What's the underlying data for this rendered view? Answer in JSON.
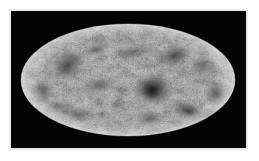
{
  "figure": {
    "kind": "all-sky-map",
    "projection": "Mollweide",
    "title": "",
    "caption": "",
    "background_color": "#ffffff",
    "panel_color": "#040404",
    "colormap": "grayscale",
    "has_axes": false,
    "has_colorbar": false,
    "has_gridlines": false,
    "has_text_labels": false
  },
  "panel": {
    "x": 11,
    "y": 11,
    "width": 235,
    "height": 137,
    "fill": "#040404",
    "shadow_color": "#e9e9e9"
  },
  "ellipse": {
    "center_x": 117,
    "center_y": 69,
    "radius_x": 107,
    "radius_y": 56,
    "base_light": "#d4d4d4",
    "base_mid": "#b4b4b4",
    "base_dark": "#6a6a6a",
    "deepest_dark": "#101010"
  },
  "chart_data": {
    "type": "heatmap",
    "title": "",
    "subtitle": "",
    "xlabel": "",
    "ylabel": "",
    "legend": [],
    "grid": false,
    "projection": "Mollweide full-sky ellipse",
    "colormap": "grayscale (light = low signal, dark = high signal)",
    "value_range_label": "",
    "tick_labels": [],
    "annotations": [],
    "features": [
      {
        "name": "central-dense-cluster",
        "cx": 0.235,
        "cy": 0.155,
        "rx": 0.115,
        "ry": 0.175,
        "intensity": 0.96
      },
      {
        "name": "upper-right-filament",
        "cx": 0.43,
        "cy": -0.43,
        "rx": 0.15,
        "ry": 0.11,
        "intensity": 0.72
      },
      {
        "name": "right-edge-knot",
        "cx": 0.83,
        "cy": 0.26,
        "rx": 0.095,
        "ry": 0.15,
        "intensity": 0.68
      },
      {
        "name": "lower-right-streak",
        "cx": 0.56,
        "cy": 0.56,
        "rx": 0.175,
        "ry": 0.105,
        "intensity": 0.66
      },
      {
        "name": "left-upper-patch",
        "cx": -0.56,
        "cy": -0.27,
        "rx": 0.17,
        "ry": 0.16,
        "intensity": 0.62
      },
      {
        "name": "left-edge-clump",
        "cx": -0.8,
        "cy": 0.19,
        "rx": 0.11,
        "ry": 0.17,
        "intensity": 0.6
      },
      {
        "name": "mid-left-band",
        "cx": -0.27,
        "cy": 0.11,
        "rx": 0.175,
        "ry": 0.095,
        "intensity": 0.55
      },
      {
        "name": "lower-left-arc",
        "cx": -0.48,
        "cy": 0.6,
        "rx": 0.15,
        "ry": 0.095,
        "intensity": 0.58
      },
      {
        "name": "upper-center-wisp",
        "cx": 0.05,
        "cy": -0.56,
        "rx": 0.19,
        "ry": 0.09,
        "intensity": 0.5
      },
      {
        "name": "far-right-lower",
        "cx": 0.76,
        "cy": 0.62,
        "rx": 0.11,
        "ry": 0.09,
        "intensity": 0.52
      },
      {
        "name": "upper-far-right",
        "cx": 0.7,
        "cy": -0.26,
        "rx": 0.13,
        "ry": 0.15,
        "intensity": 0.58
      },
      {
        "name": "bottom-center-patch",
        "cx": 0.2,
        "cy": 0.69,
        "rx": 0.14,
        "ry": 0.09,
        "intensity": 0.48
      }
    ]
  }
}
